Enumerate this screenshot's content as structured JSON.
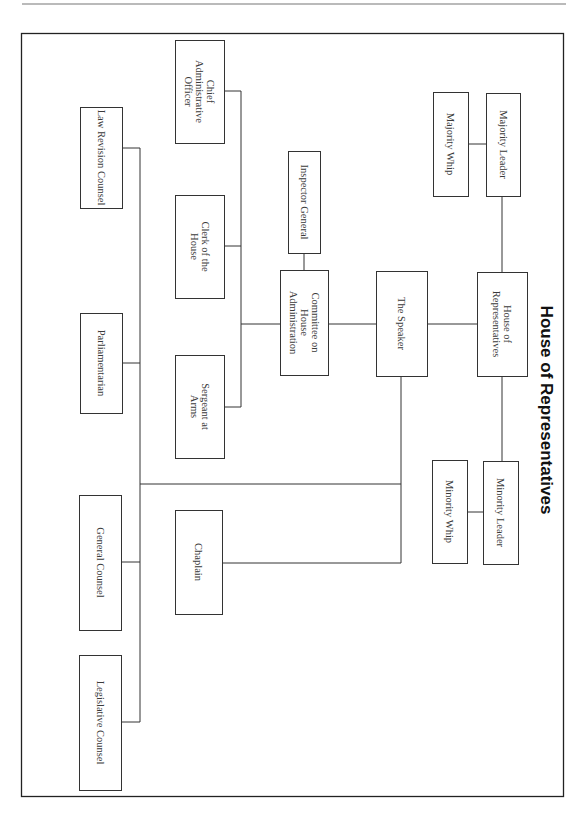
{
  "title": "House of Representatives",
  "nodes": {
    "house": {
      "lines": [
        "House of",
        "Representatives"
      ]
    },
    "majority_leader": {
      "lines": [
        "Majority Leader"
      ]
    },
    "majority_whip": {
      "lines": [
        "Majority Whip"
      ]
    },
    "minority_leader": {
      "lines": [
        "Minority Leader"
      ]
    },
    "minority_whip": {
      "lines": [
        "Minority Whip"
      ]
    },
    "speaker": {
      "lines": [
        "The Speaker"
      ]
    },
    "committee": {
      "lines": [
        "Committee on",
        "House",
        "Administration"
      ]
    },
    "inspector_general": {
      "lines": [
        "Inspector General"
      ]
    },
    "chief_admin_officer": {
      "lines": [
        "Chief",
        "Administrative",
        "Officer"
      ]
    },
    "clerk": {
      "lines": [
        "Clerk of the",
        "House"
      ]
    },
    "sergeant_at_arms": {
      "lines": [
        "Sergeant at",
        "Arms"
      ]
    },
    "law_revision_counsel": {
      "lines": [
        "Law Revision Counsel"
      ]
    },
    "parliamentarian": {
      "lines": [
        "Parliamentarian"
      ]
    },
    "general_counsel": {
      "lines": [
        "General Counsel"
      ]
    },
    "legislative_counsel": {
      "lines": [
        "Legislative Counsel"
      ]
    },
    "chaplain": {
      "lines": [
        "Chaplain"
      ]
    }
  },
  "edges": [
    [
      "house",
      "majority_leader"
    ],
    [
      "majority_leader",
      "majority_whip"
    ],
    [
      "house",
      "minority_leader"
    ],
    [
      "minority_leader",
      "minority_whip"
    ],
    [
      "house",
      "speaker"
    ],
    [
      "speaker",
      "committee"
    ],
    [
      "committee",
      "inspector_general"
    ],
    [
      "committee",
      "chief_admin_officer"
    ],
    [
      "committee",
      "clerk"
    ],
    [
      "committee",
      "sergeant_at_arms"
    ],
    [
      "speaker",
      "chaplain"
    ],
    [
      "speaker",
      "law_revision_counsel"
    ],
    [
      "speaker",
      "parliamentarian"
    ],
    [
      "speaker",
      "general_counsel"
    ],
    [
      "speaker",
      "legislative_counsel"
    ]
  ]
}
